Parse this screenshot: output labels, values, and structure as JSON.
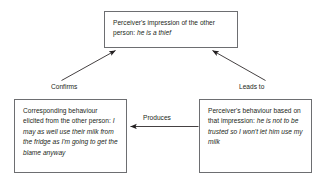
{
  "diagram": {
    "background_color": "#ffffff",
    "line_color": "#231f20",
    "box_border_color": "#6d6e71",
    "nodes": [
      {
        "id": "impression",
        "label_plain": "Perceiver's impression of the other person: he is a thief",
        "lead": "Perceiver's impression of the other person: ",
        "emphasis": "he is a thief"
      },
      {
        "id": "corresponding",
        "label_plain": "Corresponding behaviour elicited from the other person: I may as well use their milk from the fridge as I'm going to get the blame anyway",
        "lead": "Corresponding behaviour elicited from the other person: ",
        "emphasis": "I may as well use their milk from the fridge as I'm going to get the blame anyway"
      },
      {
        "id": "perceiver-behaviour",
        "label_plain": "Perceiver's behaviour based on that impression: he is not to be trusted so I won't let him use my milk",
        "lead": "Perceiver's behaviour based on that impression: ",
        "emphasis": "he is not to be trusted so I won't let him use my milk"
      }
    ],
    "edges": [
      {
        "id": "confirms",
        "label": "Confirms",
        "from": "corresponding",
        "to": "impression",
        "direction": "up-right"
      },
      {
        "id": "leads-to",
        "label": "Leads to",
        "from": "impression",
        "to": "perceiver-behaviour",
        "direction": "up-left"
      },
      {
        "id": "produces",
        "label": "Produces",
        "from": "perceiver-behaviour",
        "to": "corresponding",
        "direction": "left"
      }
    ]
  }
}
